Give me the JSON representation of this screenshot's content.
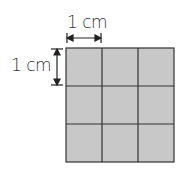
{
  "diagram": {
    "grid": {
      "rows": 3,
      "cols": 3,
      "fill": "#c8c8c8",
      "line": "#333333"
    },
    "top_label": "1 cm",
    "left_label": "1 cm",
    "colors": {
      "text": "#333333",
      "arrow": "#222222"
    }
  }
}
